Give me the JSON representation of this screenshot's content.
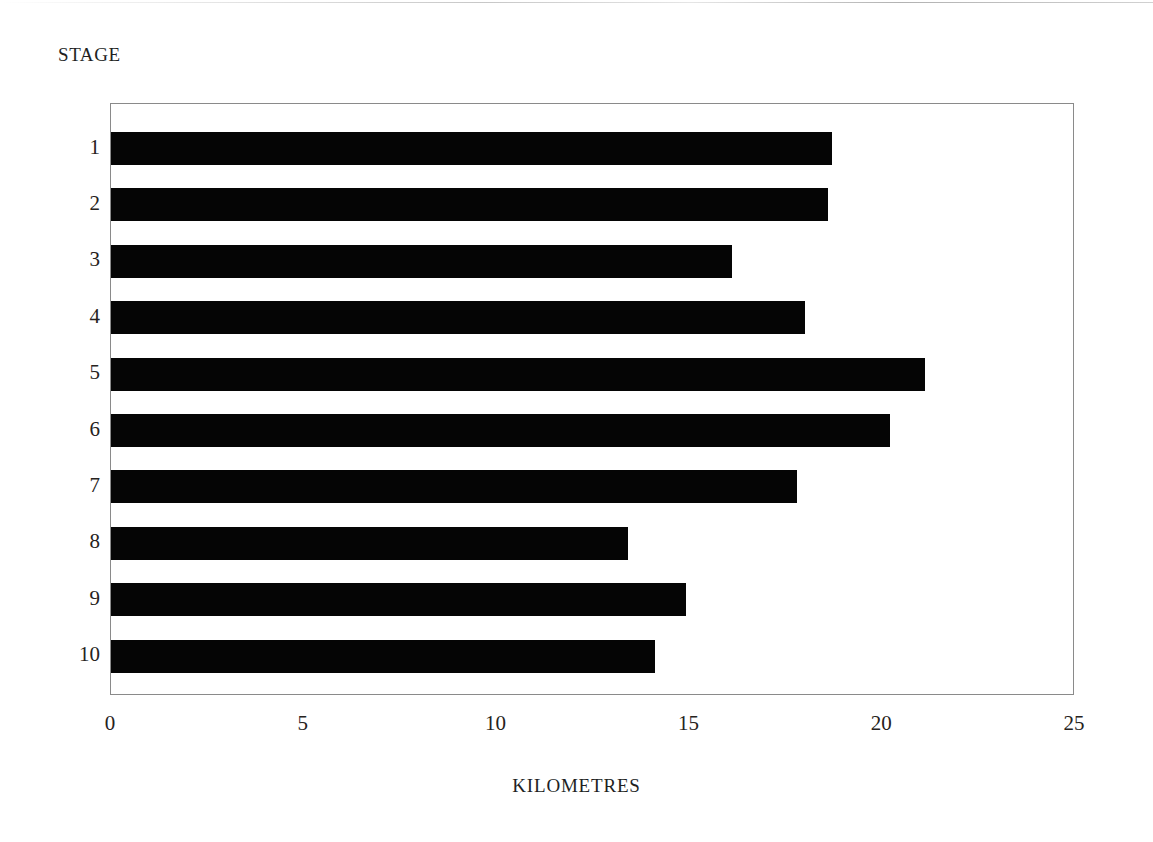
{
  "chart_data": {
    "type": "bar",
    "orientation": "horizontal",
    "title": "",
    "xlabel": "KILOMETRES",
    "ylabel": "STAGE",
    "categories": [
      "1",
      "2",
      "3",
      "4",
      "5",
      "6",
      "7",
      "8",
      "9",
      "10"
    ],
    "values": [
      18.7,
      18.6,
      16.1,
      18.0,
      21.1,
      20.2,
      17.8,
      13.4,
      14.9,
      14.1
    ],
    "xlim": [
      0,
      25
    ],
    "xticks": [
      "0",
      "5",
      "10",
      "15",
      "20",
      "25"
    ],
    "xtick_values": [
      0,
      5,
      10,
      15,
      20,
      25
    ],
    "grid": false,
    "legend": false,
    "bar_color": "#050505",
    "frame_color": "#8a8a8a",
    "background_color": "#ffffff"
  },
  "figure": {
    "y_axis_title": "STAGE",
    "x_axis_title": "KILOMETRES"
  }
}
